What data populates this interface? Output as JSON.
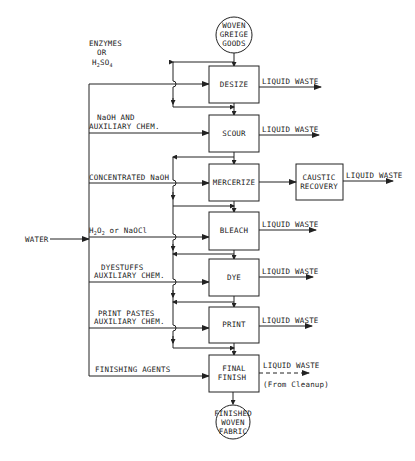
{
  "diagram": {
    "type": "process-flow",
    "start_node": {
      "lines": [
        "WOVEN",
        "GREIGE",
        "GOODS"
      ]
    },
    "end_node": {
      "lines": [
        "FINISHED",
        "WOVEN",
        "FABRIC"
      ]
    },
    "water_label": "WATER",
    "processes": [
      {
        "id": "desize",
        "label": "DESIZE",
        "input": [
          "ENZYMES",
          "OR",
          "H2SO4"
        ],
        "output": "LIQUID WASTE"
      },
      {
        "id": "scour",
        "label": "SCOUR",
        "input": [
          "NaOH AND",
          "AUXILIARY CHEM."
        ],
        "output": "LIQUID WASTE"
      },
      {
        "id": "mercerize",
        "label": "MERCERIZE",
        "input": [
          "CONCENTRATED NaOH"
        ],
        "output": "CAUSTIC RECOVERY"
      },
      {
        "id": "bleach",
        "label": "BLEACH",
        "input": [
          "H2O2 or NaOCl"
        ],
        "output": "LIQUID WASTE"
      },
      {
        "id": "dye",
        "label": "DYE",
        "input": [
          "DYESTUFFS",
          "AUXILIARY CHEM."
        ],
        "output": "LIQUID WASTE"
      },
      {
        "id": "print",
        "label": "PRINT",
        "input": [
          "PRINT PASTES",
          "AUXILIARY CHEM."
        ],
        "output": "LIQUID WASTE"
      },
      {
        "id": "final-finish",
        "label_lines": [
          "FINAL",
          "FINISH"
        ],
        "input": [
          "FINISHING AGENTS"
        ],
        "output": "LIQUID WASTE",
        "output_note": "(From Cleanup)"
      }
    ],
    "caustic_recovery": {
      "lines": [
        "CAUSTIC",
        "RECOVERY"
      ],
      "output": "LIQUID WASTE"
    }
  },
  "labels": {
    "start1": "WOVEN",
    "start2": "GREIGE",
    "start3": "GOODS",
    "end1": "FINISHED",
    "end2": "WOVEN",
    "end3": "FABRIC",
    "water": "WATER",
    "desize": "DESIZE",
    "scour": "SCOUR",
    "mercerize": "MERCERIZE",
    "bleach": "BLEACH",
    "dye": "DYE",
    "print": "PRINT",
    "final1": "FINAL",
    "final2": "FINISH",
    "caustic1": "CAUSTIC",
    "caustic2": "RECOVERY",
    "waste": "LIQUID WASTE",
    "cleanup": "(From Cleanup)",
    "in_desize1": "ENZYMES",
    "in_desize2": "OR",
    "in_desize3_h": "H",
    "in_desize3_2": "2",
    "in_desize3_so": "SO",
    "in_desize3_4": "4",
    "in_scour1": "NaOH AND",
    "in_scour2": "AUXILIARY CHEM.",
    "in_merc": "CONCENTRATED NaOH",
    "in_bleach_h": "H",
    "in_bleach_2a": "2",
    "in_bleach_o": "O",
    "in_bleach_2b": "2",
    "in_bleach_rest": " or NaOCl",
    "in_dye1": "DYESTUFFS",
    "in_dye2": "AUXILIARY CHEM.",
    "in_print1": "PRINT PASTES",
    "in_print2": "AUXILIARY CHEM.",
    "in_final": "FINISHING AGENTS"
  }
}
